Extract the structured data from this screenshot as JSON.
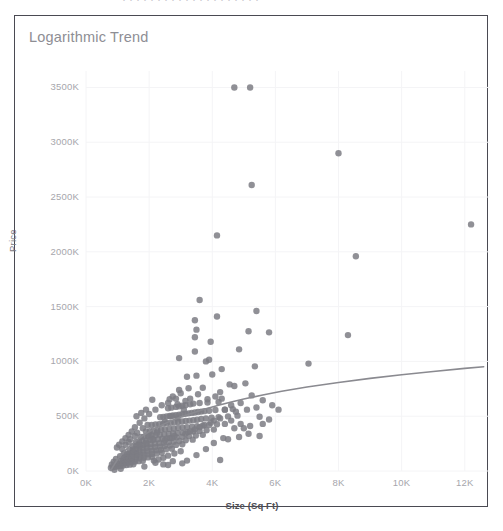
{
  "page": {
    "background_color": "#ffffff",
    "top_sliver_text": "· ·  · · ·  ·  · · · ·  · ·   · · ·  · · · · ·"
  },
  "chart_frame": {
    "border_color": "#4a4a52",
    "background_color": "#ffffff"
  },
  "chart_data": {
    "type": "scatter",
    "title": "Logarithmic Trend",
    "xlabel": "Size (Sq Ft)",
    "ylabel": "Price",
    "grid": true,
    "grid_color": "#f4f4f6",
    "legend": null,
    "legend_position": "none",
    "point_color": "#7d7d84",
    "point_radius": 3.2,
    "point_opacity": 0.85,
    "trendline": {
      "name": "Logarithmic trend",
      "color": "#8a8a90",
      "width": 1.6,
      "type": "logarithmic",
      "points": [
        [
          780,
          5000
        ],
        [
          900,
          60000
        ],
        [
          1000,
          105000
        ],
        [
          1200,
          175000
        ],
        [
          1400,
          232000
        ],
        [
          1600,
          280000
        ],
        [
          1800,
          322000
        ],
        [
          2000,
          358000
        ],
        [
          2300,
          405000
        ],
        [
          2600,
          446000
        ],
        [
          3000,
          492000
        ],
        [
          3400,
          532000
        ],
        [
          3800,
          568000
        ],
        [
          4200,
          600000
        ],
        [
          4600,
          630000
        ],
        [
          5000,
          657000
        ],
        [
          5600,
          694000
        ],
        [
          6200,
          727000
        ],
        [
          7000,
          766000
        ],
        [
          8000,
          808000
        ],
        [
          9000,
          845000
        ],
        [
          10000,
          878000
        ],
        [
          11000,
          908000
        ],
        [
          12000,
          936000
        ],
        [
          12600,
          951000
        ]
      ]
    },
    "xlim": [
      0,
      12800
    ],
    "ylim": [
      0,
      3650000
    ],
    "xticks": [
      0,
      2000,
      4000,
      6000,
      8000,
      10000,
      12000
    ],
    "xticklabels": [
      "0K",
      "2K",
      "4K",
      "6K",
      "8K",
      "10K",
      "12K"
    ],
    "yticks": [
      0,
      500000,
      1000000,
      1500000,
      2000000,
      2500000,
      3000000,
      3500000
    ],
    "yticklabels": [
      "0K",
      "500K",
      "1000K",
      "1500K",
      "2000K",
      "2500K",
      "3000K",
      "3500K"
    ],
    "points": [
      [
        4700,
        3500000
      ],
      [
        5200,
        3500000
      ],
      [
        8000,
        2900000
      ],
      [
        5250,
        2610000
      ],
      [
        12200,
        2250000
      ],
      [
        8550,
        1960000
      ],
      [
        4150,
        2150000
      ],
      [
        3600,
        1560000
      ],
      [
        5400,
        1460000
      ],
      [
        4150,
        1410000
      ],
      [
        3450,
        1375000
      ],
      [
        3500,
        1290000
      ],
      [
        8300,
        1240000
      ],
      [
        5150,
        1275000
      ],
      [
        5800,
        1265000
      ],
      [
        3450,
        1220000
      ],
      [
        3950,
        1180000
      ],
      [
        4850,
        1110000
      ],
      [
        3450,
        1090000
      ],
      [
        3900,
        1015000
      ],
      [
        3800,
        1000000
      ],
      [
        2950,
        1030000
      ],
      [
        7050,
        980000
      ],
      [
        5350,
        955000
      ],
      [
        4300,
        930000
      ],
      [
        4000,
        880000
      ],
      [
        3500,
        870000
      ],
      [
        3200,
        860000
      ],
      [
        5050,
        800000
      ],
      [
        4550,
        790000
      ],
      [
        4700,
        775000
      ],
      [
        3700,
        760000
      ],
      [
        3250,
        755000
      ],
      [
        2950,
        740000
      ],
      [
        4250,
        720000
      ],
      [
        3000,
        710000
      ],
      [
        5250,
        690000
      ],
      [
        4300,
        660000
      ],
      [
        2750,
        680000
      ],
      [
        2650,
        655000
      ],
      [
        5600,
        645000
      ],
      [
        4200,
        630000
      ],
      [
        3850,
        625000
      ],
      [
        3600,
        620000
      ],
      [
        3400,
        615000
      ],
      [
        3300,
        608000
      ],
      [
        3150,
        600000
      ],
      [
        3050,
        596000
      ],
      [
        2950,
        590000
      ],
      [
        2850,
        585000
      ],
      [
        2700,
        578000
      ],
      [
        2600,
        572000
      ],
      [
        4650,
        565000
      ],
      [
        4400,
        560000
      ],
      [
        4100,
        556000
      ],
      [
        3900,
        550000
      ],
      [
        3750,
        546000
      ],
      [
        3650,
        542000
      ],
      [
        3550,
        538000
      ],
      [
        3450,
        534000
      ],
      [
        3350,
        530000
      ],
      [
        3250,
        526000
      ],
      [
        3150,
        522000
      ],
      [
        3050,
        518000
      ],
      [
        2950,
        514000
      ],
      [
        2850,
        510000
      ],
      [
        2750,
        506000
      ],
      [
        2650,
        502000
      ],
      [
        2550,
        498000
      ],
      [
        2450,
        494000
      ],
      [
        2350,
        490000
      ],
      [
        4800,
        505000
      ],
      [
        4500,
        498000
      ],
      [
        4200,
        492000
      ],
      [
        3980,
        486000
      ],
      [
        3800,
        480000
      ],
      [
        3650,
        474000
      ],
      [
        3520,
        468000
      ],
      [
        3400,
        464000
      ],
      [
        3280,
        460000
      ],
      [
        3160,
        456000
      ],
      [
        3040,
        452000
      ],
      [
        2920,
        448000
      ],
      [
        2800,
        444000
      ],
      [
        2680,
        440000
      ],
      [
        2560,
        436000
      ],
      [
        2440,
        432000
      ],
      [
        2320,
        428000
      ],
      [
        2200,
        424000
      ],
      [
        2080,
        420000
      ],
      [
        4400,
        430000
      ],
      [
        4150,
        426000
      ],
      [
        3900,
        420000
      ],
      [
        3700,
        414000
      ],
      [
        3520,
        408000
      ],
      [
        3360,
        404000
      ],
      [
        3200,
        400000
      ],
      [
        3060,
        396000
      ],
      [
        2920,
        392000
      ],
      [
        2780,
        388000
      ],
      [
        2640,
        384000
      ],
      [
        2500,
        380000
      ],
      [
        2380,
        376000
      ],
      [
        2260,
        372000
      ],
      [
        2140,
        368000
      ],
      [
        2020,
        364000
      ],
      [
        1900,
        360000
      ],
      [
        4050,
        378000
      ],
      [
        3820,
        372000
      ],
      [
        3600,
        366000
      ],
      [
        3400,
        360000
      ],
      [
        3220,
        355000
      ],
      [
        3060,
        350000
      ],
      [
        2900,
        346000
      ],
      [
        2760,
        342000
      ],
      [
        2620,
        338000
      ],
      [
        2480,
        334000
      ],
      [
        2340,
        330000
      ],
      [
        2200,
        326000
      ],
      [
        2080,
        322000
      ],
      [
        1960,
        318000
      ],
      [
        1840,
        314000
      ],
      [
        1740,
        310000
      ],
      [
        3700,
        330000
      ],
      [
        3480,
        324000
      ],
      [
        3260,
        318000
      ],
      [
        3060,
        312000
      ],
      [
        2880,
        307000
      ],
      [
        2720,
        302000
      ],
      [
        2560,
        298000
      ],
      [
        2420,
        294000
      ],
      [
        2280,
        290000
      ],
      [
        2140,
        286000
      ],
      [
        2020,
        282000
      ],
      [
        1900,
        278000
      ],
      [
        1780,
        274000
      ],
      [
        1680,
        270000
      ],
      [
        1580,
        266000
      ],
      [
        3380,
        286000
      ],
      [
        3160,
        280000
      ],
      [
        2960,
        274000
      ],
      [
        2780,
        268000
      ],
      [
        2620,
        263000
      ],
      [
        2460,
        258000
      ],
      [
        2320,
        254000
      ],
      [
        2180,
        250000
      ],
      [
        2050,
        246000
      ],
      [
        1920,
        242000
      ],
      [
        1800,
        238000
      ],
      [
        1690,
        234000
      ],
      [
        1590,
        230000
      ],
      [
        1490,
        226000
      ],
      [
        3050,
        244000
      ],
      [
        2850,
        238000
      ],
      [
        2660,
        232000
      ],
      [
        2490,
        227000
      ],
      [
        2340,
        222000
      ],
      [
        2190,
        218000
      ],
      [
        2050,
        214000
      ],
      [
        1920,
        210000
      ],
      [
        1800,
        206000
      ],
      [
        1690,
        202000
      ],
      [
        1580,
        198000
      ],
      [
        1480,
        194000
      ],
      [
        1390,
        190000
      ],
      [
        2720,
        204000
      ],
      [
        2540,
        198000
      ],
      [
        2370,
        193000
      ],
      [
        2220,
        188000
      ],
      [
        2080,
        184000
      ],
      [
        1940,
        180000
      ],
      [
        1810,
        176000
      ],
      [
        1690,
        172000
      ],
      [
        1580,
        168000
      ],
      [
        1480,
        164000
      ],
      [
        1380,
        160000
      ],
      [
        1290,
        156000
      ],
      [
        2400,
        166000
      ],
      [
        2240,
        160000
      ],
      [
        2090,
        156000
      ],
      [
        1950,
        152000
      ],
      [
        1820,
        148000
      ],
      [
        1700,
        144000
      ],
      [
        1580,
        140000
      ],
      [
        1470,
        136000
      ],
      [
        1370,
        132000
      ],
      [
        1280,
        128000
      ],
      [
        1190,
        124000
      ],
      [
        2100,
        128000
      ],
      [
        1960,
        124000
      ],
      [
        1830,
        120000
      ],
      [
        1700,
        116000
      ],
      [
        1580,
        112000
      ],
      [
        1470,
        108000
      ],
      [
        1360,
        104000
      ],
      [
        1260,
        100000
      ],
      [
        1170,
        96000
      ],
      [
        1080,
        92000
      ],
      [
        1800,
        94000
      ],
      [
        1670,
        90000
      ],
      [
        1550,
        86000
      ],
      [
        1440,
        82000
      ],
      [
        1330,
        78000
      ],
      [
        1230,
        74000
      ],
      [
        1140,
        70000
      ],
      [
        1050,
        66000
      ],
      [
        970,
        62000
      ],
      [
        1500,
        62000
      ],
      [
        1390,
        58000
      ],
      [
        1280,
        54000
      ],
      [
        1180,
        50000
      ],
      [
        1090,
        46000
      ],
      [
        1000,
        42000
      ],
      [
        920,
        38000
      ],
      [
        850,
        34000
      ],
      [
        790,
        30000
      ],
      [
        2600,
        140000
      ],
      [
        2800,
        160000
      ],
      [
        3000,
        180000
      ],
      [
        2450,
        120000
      ],
      [
        2300,
        105000
      ],
      [
        2150,
        95000
      ],
      [
        1400,
        290000
      ],
      [
        1550,
        320000
      ],
      [
        1250,
        240000
      ],
      [
        1150,
        200000
      ],
      [
        1620,
        350000
      ],
      [
        1350,
        265000
      ],
      [
        1800,
        390000
      ],
      [
        1950,
        420000
      ],
      [
        1500,
        175000
      ],
      [
        1700,
        230000
      ],
      [
        2900,
        480000
      ],
      [
        2250,
        350000
      ],
      [
        2100,
        290000
      ],
      [
        1900,
        255000
      ],
      [
        3100,
        560000
      ],
      [
        2700,
        500000
      ],
      [
        2500,
        450000
      ],
      [
        2000,
        330000
      ],
      [
        1600,
        150000
      ],
      [
        1450,
        125000
      ],
      [
        4400,
        560000
      ],
      [
        4600,
        600000
      ],
      [
        4900,
        620000
      ],
      [
        5100,
        560000
      ],
      [
        5400,
        580000
      ],
      [
        4750,
        540000
      ],
      [
        5500,
        495000
      ],
      [
        5800,
        470000
      ],
      [
        4250,
        100000
      ],
      [
        3200,
        95000
      ],
      [
        2450,
        60000
      ],
      [
        1850,
        40000
      ],
      [
        1100,
        20000
      ],
      [
        900,
        12000
      ],
      [
        2600,
        55000
      ],
      [
        3050,
        70000
      ],
      [
        3500,
        145000
      ],
      [
        3800,
        200000
      ],
      [
        4050,
        255000
      ],
      [
        4350,
        300000
      ],
      [
        2750,
        90000
      ],
      [
        2200,
        75000
      ],
      [
        3300,
        660000
      ],
      [
        3550,
        700000
      ],
      [
        3150,
        640000
      ],
      [
        2900,
        610000
      ],
      [
        4100,
        680000
      ],
      [
        3850,
        655000
      ],
      [
        4600,
        460000
      ],
      [
        4900,
        430000
      ],
      [
        5000,
        390000
      ],
      [
        5200,
        410000
      ],
      [
        4700,
        390000
      ],
      [
        5600,
        430000
      ],
      [
        2400,
        600000
      ],
      [
        2200,
        560000
      ],
      [
        2000,
        520000
      ],
      [
        1850,
        480000
      ],
      [
        1700,
        440000
      ],
      [
        2100,
        650000
      ],
      [
        2600,
        620000
      ],
      [
        2850,
        660000
      ],
      [
        1550,
        400000
      ],
      [
        1450,
        360000
      ],
      [
        1350,
        330000
      ],
      [
        1250,
        300000
      ],
      [
        1150,
        270000
      ],
      [
        1050,
        240000
      ],
      [
        980,
        215000
      ],
      [
        1600,
        500000
      ],
      [
        1750,
        530000
      ],
      [
        1900,
        560000
      ],
      [
        1200,
        160000
      ],
      [
        1080,
        135000
      ],
      [
        950,
        110000
      ],
      [
        880,
        85000
      ],
      [
        820,
        60000
      ],
      [
        4050,
        460000
      ],
      [
        4250,
        480000
      ],
      [
        3950,
        440000
      ],
      [
        3750,
        420000
      ],
      [
        3600,
        400000
      ],
      [
        3450,
        380000
      ],
      [
        3300,
        360000
      ],
      [
        3150,
        340000
      ],
      [
        2650,
        300000
      ],
      [
        2500,
        280000
      ],
      [
        2800,
        320000
      ],
      [
        5150,
        340000
      ],
      [
        5500,
        320000
      ],
      [
        4850,
        310000
      ],
      [
        4500,
        290000
      ],
      [
        6100,
        560000
      ],
      [
        5900,
        600000
      ]
    ]
  },
  "axis_style": {
    "tick_label_color": "#a6a6ac",
    "y_title_color": "#7b7b82",
    "x_title_color": "#4e4e55",
    "title_color": "#8e8e94"
  }
}
